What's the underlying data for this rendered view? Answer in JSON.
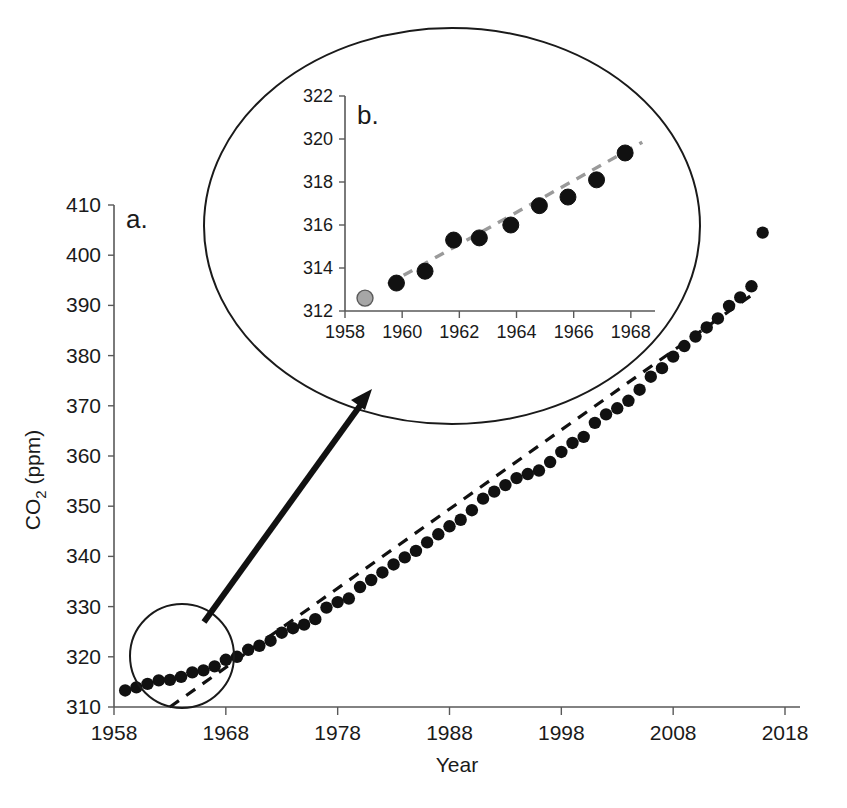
{
  "figure": {
    "panels": [
      {
        "id": "a",
        "label": "a."
      },
      {
        "id": "b",
        "label": "b."
      }
    ],
    "callout": {
      "source_circle_name": "zoom-source-circle",
      "arrow_name": "zoom-arrow",
      "ellipse_name": "zoom-detail-ellipse"
    }
  },
  "chart_data": [
    {
      "type": "scatter",
      "panel": "a",
      "title": "",
      "xlabel": "Year",
      "ylabel": "CO2 (ppm)",
      "ylabel_parts": {
        "base": "CO",
        "sub": "2",
        "unit": " (ppm)"
      },
      "xlim": [
        1958,
        2018
      ],
      "ylim": [
        310,
        410
      ],
      "xticks": [
        1958,
        1968,
        1978,
        1988,
        1998,
        2008,
        2018
      ],
      "xtick_labels": [
        "1958",
        "1968",
        "1978",
        "1988",
        "1998",
        "2008",
        "2018"
      ],
      "yticks": [
        310,
        320,
        330,
        340,
        350,
        360,
        370,
        380,
        390,
        400,
        410
      ],
      "ytick_labels": [
        "310",
        "320",
        "330",
        "340",
        "350",
        "360",
        "370",
        "380",
        "390",
        "400",
        "410"
      ],
      "grid": false,
      "legend": "none",
      "marker_color": "#111111",
      "trendline": {
        "style": "dashed",
        "color": "#111111",
        "x": [
          1963.0,
          2015.5
        ],
        "y": [
          310.0,
          392.8
        ]
      },
      "x": [
        1959,
        1960,
        1961,
        1962,
        1963,
        1964,
        1965,
        1966,
        1967,
        1968,
        1969,
        1970,
        1971,
        1972,
        1973,
        1974,
        1975,
        1976,
        1977,
        1978,
        1979,
        1980,
        1981,
        1982,
        1983,
        1984,
        1985,
        1986,
        1987,
        1988,
        1989,
        1990,
        1991,
        1992,
        1993,
        1994,
        1995,
        1996,
        1997,
        1998,
        1999,
        2000,
        2001,
        2002,
        2003,
        2004,
        2005,
        2006,
        2007,
        2008,
        2009,
        2010,
        2011,
        2012,
        2013,
        2014,
        2015,
        2016
      ],
      "y": [
        313.3,
        313.9,
        314.6,
        315.3,
        315.4,
        316.0,
        316.9,
        317.3,
        318.1,
        319.4,
        320.0,
        321.4,
        322.2,
        323.2,
        324.8,
        325.7,
        326.4,
        327.5,
        329.8,
        330.9,
        331.6,
        333.9,
        335.3,
        336.8,
        338.4,
        339.8,
        341.1,
        342.8,
        344.4,
        346.0,
        347.3,
        349.2,
        351.5,
        352.9,
        354.2,
        355.6,
        356.4,
        357.1,
        358.8,
        360.8,
        362.6,
        363.8,
        366.6,
        368.3,
        369.5,
        371.0,
        373.2,
        375.8,
        377.5,
        379.8,
        381.9,
        383.8,
        385.6,
        387.4,
        389.9,
        391.6,
        393.8,
        404.5
      ],
      "annotation": "Main Keeling-curve panel: CO2 concentration rises from ~313 ppm in 1959 to ~404 ppm in 2016, accelerating above the linear dashed trend."
    },
    {
      "type": "scatter",
      "panel": "b",
      "title": "",
      "xlabel": "",
      "ylabel": "",
      "xlim": [
        1958,
        1968.6
      ],
      "ylim": [
        312,
        322
      ],
      "xticks": [
        1958,
        1960,
        1962,
        1964,
        1966,
        1968
      ],
      "xtick_labels": [
        "1958",
        "1960",
        "1962",
        "1964",
        "1966",
        "1968"
      ],
      "yticks": [
        312,
        314,
        316,
        318,
        320,
        322
      ],
      "ytick_labels": [
        "312",
        "314",
        "316",
        "318",
        "320",
        "322"
      ],
      "grid": false,
      "legend": "none",
      "marker_color": "#111111",
      "highlight_marker_color": "#a6a6a6",
      "trendline": {
        "style": "dashed",
        "color": "#9a9a9a",
        "x": [
          1959.5,
          1968.4
        ],
        "y": [
          313.25,
          319.85
        ]
      },
      "points": [
        {
          "x": 1958.7,
          "y": 312.6,
          "highlight": true
        },
        {
          "x": 1959.8,
          "y": 313.3,
          "highlight": false
        },
        {
          "x": 1960.8,
          "y": 313.85,
          "highlight": false
        },
        {
          "x": 1961.8,
          "y": 315.3,
          "highlight": false
        },
        {
          "x": 1962.7,
          "y": 315.4,
          "highlight": false
        },
        {
          "x": 1963.8,
          "y": 316.0,
          "highlight": false
        },
        {
          "x": 1964.8,
          "y": 316.9,
          "highlight": false
        },
        {
          "x": 1965.8,
          "y": 317.3,
          "highlight": false
        },
        {
          "x": 1966.8,
          "y": 318.1,
          "highlight": false
        },
        {
          "x": 1967.8,
          "y": 319.35,
          "highlight": false
        }
      ],
      "annotation": "Inset magnification of the 1958-1968 window showing an essentially linear early rise from ~312.6 to ~319.4 ppm."
    }
  ]
}
